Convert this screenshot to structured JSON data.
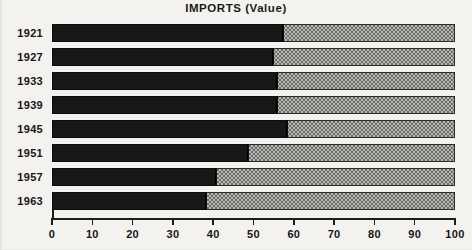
{
  "chart_data": {
    "type": "bar",
    "orientation": "horizontal",
    "stacked": true,
    "title": "IMPORTS (Value)",
    "xlabel": "",
    "ylabel": "",
    "xlim": [
      0,
      100
    ],
    "xticks": [
      0,
      10,
      20,
      30,
      40,
      50,
      60,
      70,
      80,
      90,
      100
    ],
    "xtick_labels": [
      "0",
      "10",
      "20",
      "30",
      "40",
      "50",
      "60",
      "70",
      "80",
      "90",
      "100"
    ],
    "grid": false,
    "legend": "none",
    "categories": [
      "1921",
      "1927",
      "1933",
      "1939",
      "1945",
      "1951",
      "1957",
      "1963"
    ],
    "series": [
      {
        "name": "dark-segment",
        "color": "#171717",
        "values": [
          57.5,
          55.0,
          56.0,
          56.0,
          58.5,
          49.0,
          41.0,
          38.5
        ]
      },
      {
        "name": "light-segment",
        "color": "#b9b8b4",
        "values": [
          42.5,
          45.0,
          44.0,
          44.0,
          41.5,
          51.0,
          59.0,
          61.5
        ]
      }
    ]
  }
}
